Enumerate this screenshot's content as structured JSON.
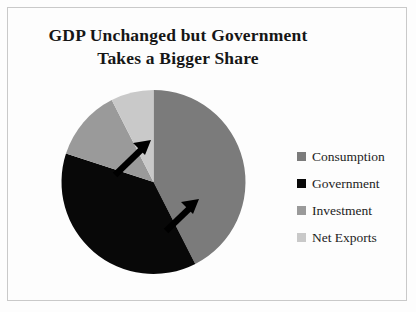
{
  "chart_data": {
    "type": "pie",
    "title": "GDP Unchanged but Government Takes a Bigger Share",
    "title_lines": [
      "GDP Unchanged but Government",
      "Takes a Bigger Share"
    ],
    "categories": [
      "Consumption",
      "Government",
      "Investment",
      "Net Exports"
    ],
    "values": [
      42.5,
      37.5,
      12.5,
      7.5
    ],
    "angles_deg": [
      153,
      135,
      45,
      27
    ],
    "colors": [
      "#7b7b7b",
      "#080808",
      "#9a9a9a",
      "#c9c9c9"
    ],
    "start_angle_deg": 0,
    "direction": "clockwise",
    "legend_position": "right",
    "grid": false,
    "xlabel": "",
    "ylabel": "",
    "annotations": [
      {
        "name": "growth-arrow-upper",
        "direction": "northeast",
        "note": "arrow on Government/Investment boundary"
      },
      {
        "name": "growth-arrow-lower",
        "direction": "northeast",
        "note": "arrow on Government/Consumption boundary"
      }
    ]
  },
  "legend": {
    "items": [
      {
        "label": "Consumption",
        "color": "#7b7b7b"
      },
      {
        "label": "Government",
        "color": "#080808"
      },
      {
        "label": "Investment",
        "color": "#9a9a9a"
      },
      {
        "label": "Net Exports",
        "color": "#c9c9c9"
      }
    ]
  },
  "frame": {
    "border_color": "#c9c9c9"
  }
}
